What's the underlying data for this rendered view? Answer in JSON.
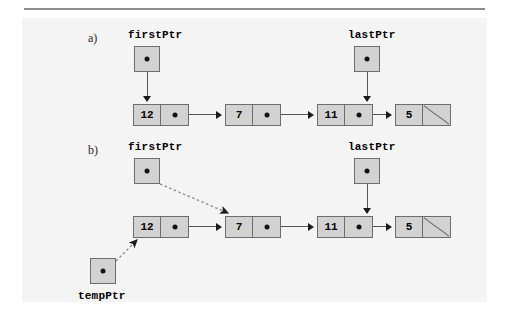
{
  "figure": {
    "background_color": "#f4f4f4",
    "box_fill_color": "#d2d2d2",
    "box_border_color": "#6d6d6d",
    "line_color": "#555555",
    "arrow_color": "#1a1a1a"
  },
  "panels": [
    {
      "letter": "a)",
      "pointers": [
        {
          "name": "firstPtr",
          "label": "firstPtr"
        },
        {
          "name": "lastPtr",
          "label": "lastPtr"
        }
      ],
      "nodes": [
        {
          "value": "12",
          "link": "dot"
        },
        {
          "value": "7",
          "link": "dot"
        },
        {
          "value": "11",
          "link": "dot"
        },
        {
          "value": "5",
          "link": "null"
        }
      ]
    },
    {
      "letter": "b)",
      "pointers": [
        {
          "name": "firstPtr",
          "label": "firstPtr"
        },
        {
          "name": "lastPtr",
          "label": "lastPtr"
        },
        {
          "name": "tempPtr",
          "label": "tempPtr"
        }
      ],
      "nodes": [
        {
          "value": "12",
          "link": "dot"
        },
        {
          "value": "7",
          "link": "dot"
        },
        {
          "value": "11",
          "link": "dot"
        },
        {
          "value": "5",
          "link": "null"
        }
      ]
    }
  ]
}
